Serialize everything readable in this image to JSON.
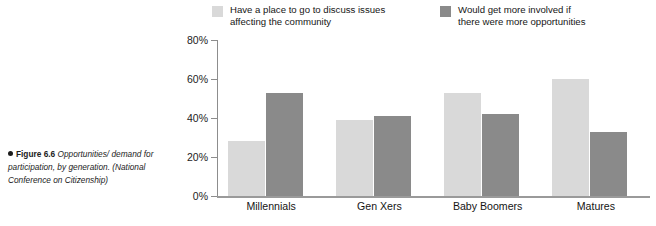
{
  "figure": {
    "bullet_icon": "filled-circle-bullet",
    "label": "Figure 6.6",
    "caption": " Opportunities/ demand for participation, by generation. (National Conference on Citizenship)"
  },
  "colors": {
    "series_light": "#d9d9d9",
    "series_dark": "#8a8a8a",
    "axis": "#8d8d8d",
    "text": "#1c1c1c"
  },
  "chart_data": {
    "type": "bar",
    "title": "",
    "xlabel": "",
    "ylabel": "",
    "ylim": [
      0,
      80
    ],
    "ytick_labels": [
      "0%",
      "20%",
      "40%",
      "60%",
      "80%"
    ],
    "ytick_values": [
      0,
      20,
      40,
      60,
      80
    ],
    "grid": false,
    "legend_position": "top",
    "categories": [
      "Millennials",
      "Gen Xers",
      "Baby Boomers",
      "Matures"
    ],
    "series": [
      {
        "name": "Have a place to go to discuss issues\naffecting the community",
        "color": "#d9d9d9",
        "values": [
          28,
          39,
          53,
          60
        ]
      },
      {
        "name": "Would get more involved if\nthere were more opportunities",
        "color": "#8a8a8a",
        "values": [
          53,
          41,
          42,
          33
        ]
      }
    ]
  }
}
